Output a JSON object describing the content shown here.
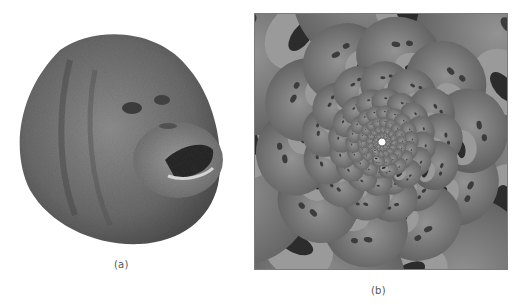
{
  "figure": {
    "panels": [
      {
        "id": "a",
        "caption": "(a)",
        "description": "Orangutan face, isolated on white background, mouth open"
      },
      {
        "id": "b",
        "caption": "(b)",
        "description": "Spiral (Droste-like) tiling of the orangutan face, faces shrinking toward the center, inside a rectangular frame"
      }
    ],
    "colors": {
      "background": "#ffffff",
      "face_dark": "#4a4a4a",
      "face_mid": "#7d7d7d",
      "face_light": "#bdbdbd",
      "frame": "#7a7a7a",
      "caption": "#555555"
    }
  }
}
